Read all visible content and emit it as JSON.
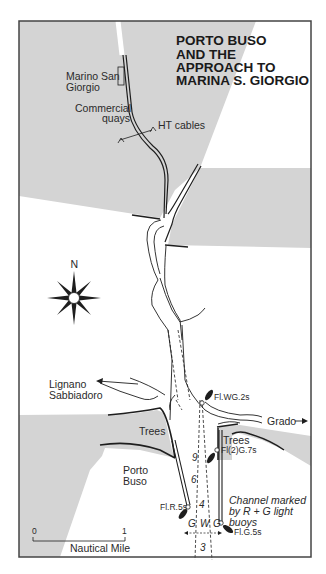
{
  "map": {
    "title_lines": [
      "PORTO BUSO",
      "AND THE",
      "APPROACH TO",
      "MARINA S. GIORGIO"
    ],
    "colors": {
      "land": "#d4d4d4",
      "water": "#ffffff",
      "frame": "#444444",
      "ink": "#1e1e1e"
    },
    "compass": {
      "label": "N"
    },
    "places": {
      "marina_line1": "Marino San",
      "marina_line2": "Giorgio",
      "quays_line1": "Commercial",
      "quays_line2": "quays",
      "cables": "HT cables",
      "lignano_line1": "Lignano",
      "lignano_line2": "Sabbiadoro",
      "grado": "Grado",
      "trees_west": "Trees",
      "trees_east": "Trees",
      "porto_line1": "Porto",
      "porto_line2": "Buso"
    },
    "lights": {
      "fl_wg": "Fl.WG.2s",
      "fl_2g": "Fl(2)G.7s",
      "fl_r": "Fl.R.5s",
      "fl_g": "Fl.G.5s"
    },
    "sectors": {
      "g_left": "G",
      "w": "W",
      "g_right": "G"
    },
    "depths": [
      "9",
      "6",
      "4",
      "3"
    ],
    "note_lines": [
      "Channel marked",
      "by R + G light",
      "buoys"
    ],
    "scale": {
      "start": "0",
      "end": "1",
      "unit": "Nautical Mile"
    },
    "arrow_grado": "→"
  }
}
